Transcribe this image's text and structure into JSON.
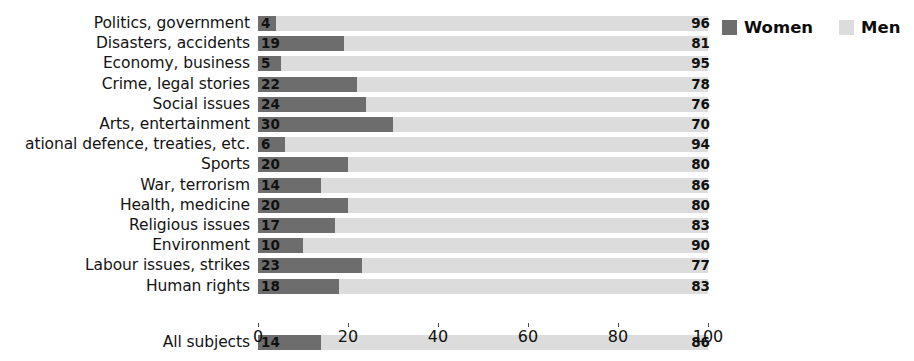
{
  "chart_data": {
    "type": "bar",
    "orientation": "horizontal",
    "stacked": true,
    "stacked_total": 100,
    "title": "",
    "subtitle": "",
    "xlabel": "",
    "ylabel": "",
    "xlim": [
      0,
      100
    ],
    "xticks": [
      0,
      20,
      40,
      60,
      80,
      100
    ],
    "xtick_labels": [
      "0",
      "20",
      "40",
      "60",
      "80",
      "100"
    ],
    "grid": false,
    "legend_position": "top-right",
    "categories": [
      "Politics, government",
      "Disasters, accidents",
      "Economy, business",
      "Crime, legal stories",
      "Social issues",
      "Arts, entertainment",
      "ational defence, treaties, etc.",
      "Sports",
      "War, terrorism",
      "Health, medicine",
      "Religious issues",
      "Environment",
      "Labour issues, strikes",
      "Human rights"
    ],
    "summary_category": "All subjects",
    "series": [
      {
        "name": "Women",
        "color": "#6d6d6d",
        "values": [
          4,
          19,
          5,
          22,
          24,
          30,
          6,
          20,
          14,
          20,
          17,
          10,
          23,
          18
        ],
        "summary_value": 14
      },
      {
        "name": "Men",
        "color": "#dcdcdc",
        "values": [
          96,
          81,
          95,
          78,
          76,
          70,
          94,
          80,
          86,
          80,
          83,
          90,
          77,
          83
        ],
        "summary_value": 86
      }
    ]
  },
  "legend": {
    "items": [
      {
        "label": "Women",
        "color": "#6d6d6d",
        "swatch": "women"
      },
      {
        "label": "Men",
        "color": "#dcdcdc",
        "swatch": "men"
      }
    ]
  }
}
